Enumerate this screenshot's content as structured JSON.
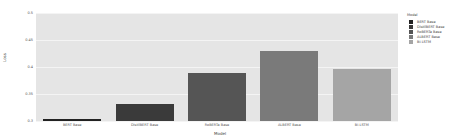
{
  "chart_data": {
    "type": "bar",
    "title": "",
    "xlabel": "Model",
    "ylabel": "Loss",
    "ylim": [
      0.3,
      0.5
    ],
    "yticks": [
      "0.5",
      "0.45",
      "0.4",
      "0.35",
      "0.3"
    ],
    "categories": [
      "BERT Base",
      "DistilBERT Base",
      "RoBERTa Base",
      "ALBERT Base",
      "Bi-LSTM"
    ],
    "values": [
      0.303,
      0.331,
      0.389,
      0.43,
      0.396
    ],
    "colors": [
      "#222222",
      "#3a3a3a",
      "#555555",
      "#7a7a7a",
      "#a5a5a5"
    ],
    "legend": {
      "title": "Model",
      "position": "right",
      "entries": [
        "BERT Base",
        "DistilBERT Base",
        "RoBERTa Base",
        "ALBERT Base",
        "Bi-LSTM"
      ]
    },
    "grid": true
  }
}
